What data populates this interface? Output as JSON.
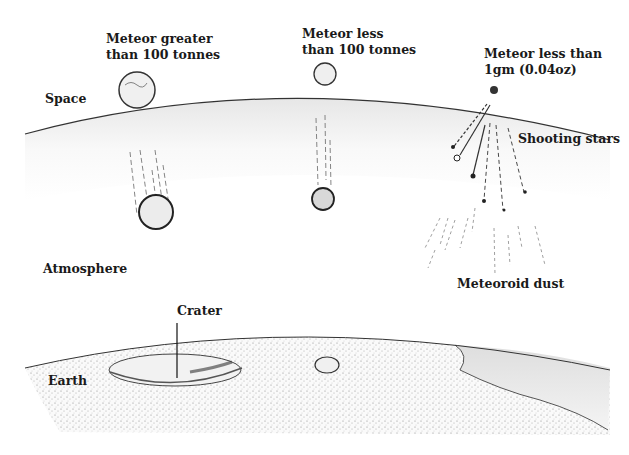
{
  "diagram": {
    "type": "illustration",
    "regions": {
      "space": "Space",
      "atmosphere": "Atmosphere",
      "earth": "Earth"
    },
    "meteors": {
      "large": {
        "line1": "Meteor greater",
        "line2": "than 100 tonnes"
      },
      "medium": {
        "line1": "Meteor less",
        "line2": "than 100 tonnes"
      },
      "small": {
        "line1": "Meteor less than",
        "line2": "1gm (0.04oz)"
      }
    },
    "phenomena": {
      "shooting_stars": "Shooting stars",
      "meteoroid_dust": "Meteoroid dust",
      "crater": "Crater"
    },
    "colors": {
      "ink": "#1a1a1a",
      "background": "#ffffff",
      "atmosphere_shade": "#e8e8e8",
      "ground_stipple": "#9a9a9a"
    }
  }
}
